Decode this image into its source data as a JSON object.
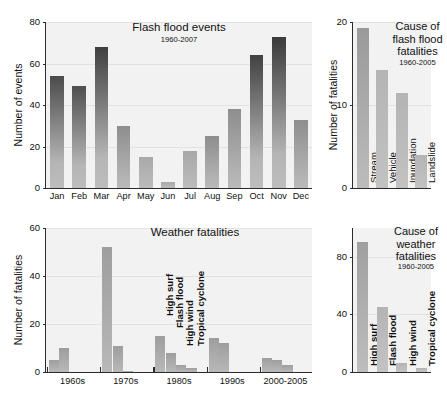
{
  "figure": {
    "panels": [
      "flash-flood-events",
      "cause-of-flash-flood-fatalities",
      "weather-fatalities",
      "cause-of-weather-fatalities"
    ]
  },
  "chart_data": [
    {
      "id": "flash-flood-events",
      "type": "bar",
      "title": "Flash flood events",
      "subtitle": "1960-2007",
      "xlabel": "",
      "ylabel": "Number of events",
      "ylim": [
        0,
        80
      ],
      "yticks": [
        0,
        20,
        40,
        60,
        80
      ],
      "ytick_labels": [
        "0",
        "20",
        "40",
        "60",
        "80"
      ],
      "grid": true,
      "categories": [
        "Jan",
        "Feb",
        "Mar",
        "Apr",
        "May",
        "Jun",
        "Jul",
        "Aug",
        "Sep",
        "Oct",
        "Nov",
        "Dec"
      ],
      "values": [
        54,
        49,
        68,
        30,
        15,
        3,
        18,
        25,
        38,
        64,
        73,
        33
      ]
    },
    {
      "id": "cause-of-flash-flood-fatalities",
      "type": "bar",
      "title": "Cause of\nflash flood\nfatalities",
      "title_lines": [
        "Cause of",
        "flash flood",
        "fatalities"
      ],
      "subtitle": "1960-2005",
      "xlabel": "",
      "ylabel": "Number of fatalities",
      "ylim": [
        0,
        20
      ],
      "yticks": [
        0,
        10,
        20
      ],
      "ytick_labels": [
        "0",
        "10",
        "20"
      ],
      "grid": true,
      "categories": [
        "Stream",
        "Vehicle",
        "Inundation",
        "Landslide"
      ],
      "values": [
        19.3,
        14.2,
        11.4,
        4.0
      ]
    },
    {
      "id": "weather-fatalities",
      "type": "bar",
      "title": "Weather fatalities",
      "subtitle": "",
      "xlabel": "",
      "ylabel": "Number of fatalities",
      "ylim": [
        0,
        60
      ],
      "yticks": [
        0,
        20,
        40,
        60
      ],
      "ytick_labels": [
        "0",
        "20",
        "40",
        "60"
      ],
      "grid": true,
      "categories": [
        "1960s",
        "1970s",
        "1980s",
        "1990s",
        "2000-2005"
      ],
      "series": [
        {
          "name": "High surf",
          "values": [
            5,
            52,
            15,
            14,
            6
          ]
        },
        {
          "name": "Flash flood",
          "values": [
            10,
            11,
            8,
            12,
            5
          ]
        },
        {
          "name": "High wind",
          "values": [
            0,
            0.6,
            3,
            0,
            3
          ]
        },
        {
          "name": "Tropical cyclone",
          "values": [
            0,
            0,
            1.5,
            0,
            0
          ]
        }
      ],
      "group_annotations": [
        "High surf",
        "Flash flood",
        "High wind",
        "Tropical cyclone"
      ],
      "annotated_group": "1980s"
    },
    {
      "id": "cause-of-weather-fatalities",
      "type": "bar",
      "title": "Cause of\nweather\nfatalities",
      "title_lines": [
        "Cause of",
        "weather",
        "fatalities"
      ],
      "subtitle": "1960-2005",
      "xlabel": "",
      "ylabel": "",
      "ylim": [
        0,
        100
      ],
      "yticks": [
        0,
        40,
        80
      ],
      "ytick_labels": [
        "0",
        "40",
        "80"
      ],
      "grid": true,
      "categories": [
        "High surf",
        "Flash flood",
        "High wind",
        "Tropical cyclone"
      ],
      "values": [
        90,
        45,
        6,
        3
      ]
    }
  ],
  "colors": {
    "plot_background": "#f2f2f2",
    "axis": "#2b2b2b",
    "grid": "#e2e2e2",
    "bar_light": "#b9b9b9",
    "bar_mid": "#8f8f8f",
    "bar_dark": "#4a4a4a",
    "text": "#111111"
  }
}
